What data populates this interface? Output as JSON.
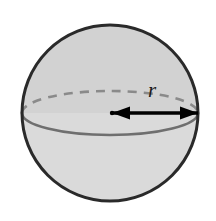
{
  "figure": {
    "name": "sphere-radius-diagram",
    "width": 216,
    "height": 221,
    "background_color": "#ffffff"
  },
  "sphere": {
    "center_x": 110,
    "center_y": 113,
    "radius": 88,
    "outline_color": "#2a2a2a",
    "outline_width": 3,
    "fill_upper_color": "#d2d2d2",
    "fill_lower_color": "#dadada"
  },
  "equator": {
    "name": "equator-ellipse",
    "center_x": 110,
    "center_y": 113,
    "radius_x": 88,
    "radius_y": 22,
    "front_color": "#6f6f6f",
    "back_color": "#8a8a8a",
    "front_width": 2.6,
    "back_width": 2.6,
    "dash_pattern": "9,7"
  },
  "radius_arrow": {
    "name": "radius-arrow",
    "start_x": 112,
    "end_x": 198,
    "y": 113,
    "color": "#000000",
    "line_width": 3.4,
    "head_length": 18,
    "head_width": 13,
    "center_dot_radius": 2.2
  },
  "labels": {
    "radius": {
      "text": "r",
      "x": 152,
      "y": 97,
      "font_size": 21,
      "color": "#1a1a1a"
    }
  },
  "chart_data": {
    "type": "diagram",
    "shapes": [
      {
        "kind": "circle",
        "name": "sphere-outline",
        "cx": 110,
        "cy": 113,
        "r": 88,
        "stroke": "#2a2a2a",
        "fill": "#d6d6d6"
      },
      {
        "kind": "ellipse",
        "name": "equator",
        "cx": 110,
        "cy": 113,
        "rx": 88,
        "ry": 22,
        "front_visible": true,
        "back_dashed": true
      },
      {
        "kind": "arrow",
        "name": "radius-measure",
        "x1": 112,
        "y1": 113,
        "x2": 198,
        "y2": 113,
        "double_headed": true,
        "label": "r",
        "length_px": 86
      }
    ],
    "annotations": [
      "r"
    ]
  }
}
